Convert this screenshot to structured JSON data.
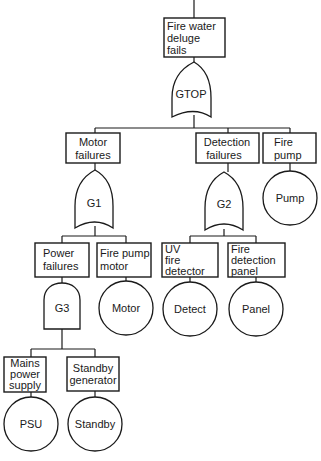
{
  "diagram": {
    "type": "fault-tree",
    "top_event": {
      "id": "top",
      "lines": [
        "Fire water",
        "deluge",
        "fails"
      ]
    },
    "gates": [
      {
        "id": "GTOP",
        "label": "GTOP",
        "kind": "OR",
        "inputs": [
          "motor_failures",
          "detection_failures",
          "fire_pump"
        ]
      },
      {
        "id": "G1",
        "label": "G1",
        "kind": "OR",
        "inputs": [
          "power_failures",
          "fire_pump_motor"
        ]
      },
      {
        "id": "G2",
        "label": "G2",
        "kind": "OR",
        "inputs": [
          "uv_fire_detector",
          "fire_detection_panel"
        ]
      },
      {
        "id": "G3",
        "label": "G3",
        "kind": "AND",
        "inputs": [
          "mains_power_supply",
          "standby_generator"
        ]
      }
    ],
    "events": {
      "motor_failures": {
        "lines": [
          "Motor",
          "failures"
        ]
      },
      "detection_failures": {
        "lines": [
          "Detection",
          "failures"
        ]
      },
      "fire_pump": {
        "lines": [
          "Fire",
          "pump"
        ]
      },
      "power_failures": {
        "lines": [
          "Power",
          "failures"
        ]
      },
      "fire_pump_motor": {
        "lines": [
          "Fire pump",
          "motor"
        ]
      },
      "uv_fire_detector": {
        "lines": [
          "UV",
          "fire",
          "detector"
        ]
      },
      "fire_detection_panel": {
        "lines": [
          "Fire",
          "detection",
          "panel"
        ]
      },
      "mains_power_supply": {
        "lines": [
          "Mains",
          "power",
          "supply"
        ]
      },
      "standby_generator": {
        "lines": [
          "Standby",
          "generator"
        ]
      }
    },
    "basic_events": {
      "pump": "Pump",
      "motor": "Motor",
      "detect": "Detect",
      "panel": "Panel",
      "psu": "PSU",
      "standby": "Standby"
    }
  }
}
